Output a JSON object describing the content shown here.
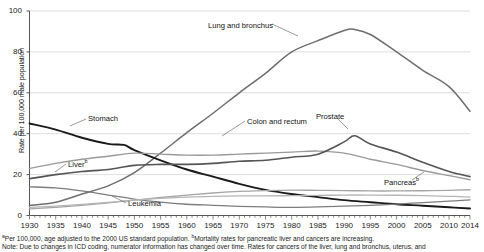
{
  "chart_data": {
    "type": "line",
    "title": "",
    "xlabel": "",
    "ylabel": "Rate per 100,000 male population",
    "xlim": [
      1930,
      2014
    ],
    "ylim": [
      0,
      100
    ],
    "yticks": [
      0,
      20,
      40,
      60,
      80,
      100
    ],
    "xticks": [
      1930,
      1935,
      1940,
      1945,
      1950,
      1955,
      1960,
      1965,
      1970,
      1975,
      1980,
      1985,
      1990,
      1995,
      2000,
      2005,
      2010,
      2014
    ],
    "grid": "horizontal",
    "legend_position": "inline-annotations",
    "minor_tick_interval": 1,
    "series": [
      {
        "name": "Lung and bronchus",
        "label": "Lung and bronchus",
        "color": "#6e6e6e",
        "width": 1.5,
        "label_x": 208,
        "label_y": 21,
        "leader": [
          [
            272,
            24
          ],
          [
            298,
            36
          ]
        ],
        "x": [
          1930,
          1935,
          1940,
          1945,
          1950,
          1955,
          1960,
          1965,
          1970,
          1975,
          1980,
          1985,
          1990,
          1992,
          1995,
          2000,
          2005,
          2010,
          2014
        ],
        "y": [
          4.9,
          6.5,
          10.5,
          14.5,
          21.0,
          30.5,
          40.5,
          50.0,
          60.0,
          69.5,
          80.0,
          85.5,
          90.5,
          91.0,
          88.5,
          80.0,
          71.0,
          63.0,
          51.0
        ]
      },
      {
        "name": "Stomach",
        "label": "Stomach",
        "color": "#1a1a1a",
        "width": 1.9,
        "label_x": 88,
        "label_y": 114,
        "leader": [
          [
            86,
            119
          ],
          [
            70,
            126
          ]
        ],
        "x": [
          1930,
          1935,
          1940,
          1945,
          1948,
          1950,
          1955,
          1960,
          1965,
          1970,
          1975,
          1980,
          1985,
          1990,
          1995,
          2000,
          2005,
          2010,
          2014
        ],
        "y": [
          45.0,
          42.0,
          38.0,
          35.0,
          34.5,
          32.0,
          27.0,
          22.5,
          19.0,
          15.5,
          12.5,
          10.5,
          9.0,
          7.5,
          6.5,
          5.5,
          4.8,
          4.0,
          3.4
        ]
      },
      {
        "name": "Colon and rectum",
        "label": "Colon and rectum",
        "color": "#9a9a9a",
        "width": 1.4,
        "label_x": 247,
        "label_y": 117,
        "leader": [
          [
            245,
            121
          ],
          [
            222,
            136
          ]
        ],
        "x": [
          1930,
          1935,
          1940,
          1945,
          1950,
          1955,
          1960,
          1965,
          1970,
          1975,
          1980,
          1985,
          1990,
          1995,
          2000,
          2005,
          2010,
          2014
        ],
        "y": [
          23.0,
          25.5,
          27.5,
          29.0,
          30.5,
          30.0,
          29.5,
          29.5,
          30.0,
          30.5,
          31.0,
          31.5,
          30.5,
          27.5,
          25.0,
          22.0,
          19.5,
          17.5
        ]
      },
      {
        "name": "Prostate",
        "label": "Prostate",
        "color": "#555555",
        "width": 1.6,
        "label_x": 316,
        "label_y": 112,
        "leader": [
          [
            337,
            118
          ],
          [
            348,
            129
          ]
        ],
        "x": [
          1930,
          1935,
          1940,
          1945,
          1950,
          1955,
          1960,
          1965,
          1970,
          1975,
          1980,
          1985,
          1990,
          1992,
          1995,
          2000,
          2005,
          2010,
          2014
        ],
        "y": [
          18.0,
          20.0,
          21.5,
          22.5,
          24.5,
          25.0,
          25.0,
          25.5,
          26.5,
          27.0,
          28.5,
          30.0,
          36.0,
          39.0,
          35.0,
          31.0,
          26.0,
          21.5,
          19.0
        ]
      },
      {
        "name": "Liver",
        "label": "Liver",
        "superscript": "b",
        "color": "#7d7d7d",
        "width": 1.3,
        "label_x": 68,
        "label_y": 158,
        "leader": [
          [
            66,
            164
          ],
          [
            55,
            172
          ]
        ],
        "x": [
          1930,
          1935,
          1940,
          1945,
          1950,
          1955,
          1960,
          1965,
          1970,
          1975,
          1980,
          1985,
          1990,
          1995,
          2000,
          2005,
          2010,
          2014
        ],
        "y": [
          14.0,
          13.5,
          12.0,
          10.0,
          8.0,
          6.5,
          5.5,
          5.0,
          4.5,
          4.2,
          4.0,
          4.2,
          4.6,
          5.0,
          5.6,
          6.3,
          7.0,
          7.6
        ]
      },
      {
        "name": "Pancreas",
        "label": "Pancreas",
        "superscript": "b",
        "color": "#a5a5a5",
        "width": 1.3,
        "label_x": 384,
        "label_y": 176,
        "leader": [
          [
            412,
            180
          ],
          [
            424,
            172
          ]
        ],
        "x": [
          1930,
          1935,
          1940,
          1945,
          1950,
          1955,
          1960,
          1965,
          1970,
          1975,
          1980,
          1985,
          1990,
          1995,
          2000,
          2005,
          2010,
          2014
        ],
        "y": [
          3.2,
          4.0,
          5.0,
          6.2,
          7.5,
          8.8,
          10.0,
          11.0,
          11.8,
          12.2,
          12.4,
          12.3,
          12.2,
          12.0,
          12.0,
          12.1,
          12.3,
          12.6
        ]
      },
      {
        "name": "Leukemia",
        "label": "Leukemia",
        "color": "#b5b5b5",
        "width": 1.3,
        "label_x": 128,
        "label_y": 199,
        "leader": [
          [
            126,
            203
          ],
          [
            112,
            196
          ]
        ],
        "x": [
          1930,
          1935,
          1940,
          1945,
          1950,
          1955,
          1960,
          1965,
          1970,
          1975,
          1980,
          1985,
          1990,
          1995,
          2000,
          2005,
          2010,
          2014
        ],
        "y": [
          4.0,
          4.6,
          5.4,
          6.4,
          7.5,
          8.4,
          9.0,
          9.4,
          9.6,
          9.6,
          9.7,
          9.8,
          10.0,
          10.0,
          9.9,
          9.7,
          9.4,
          9.0
        ]
      }
    ]
  },
  "notes": {
    "line1_a": "Per 100,000, age adjusted to the 2000 US standard population. ",
    "line1_sup1": "a",
    "line1_sup2": "b",
    "line1_b": "Mortality rates for pancreatic liver and cancers are increasing.",
    "line2": "Note: Due to changes in ICD coding, numerator information has changed over time. Rates for cancers of the liver, lung and bronchus, uterus, and"
  }
}
